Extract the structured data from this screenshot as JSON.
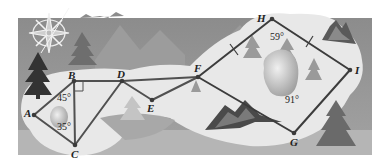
{
  "figure": {
    "colors": {
      "background_dark": "#8a8a8a",
      "background_mid": "#a8a8a8",
      "trail_region": "#e6e6e6",
      "segment_line": "#555555",
      "tree_dark": "#3a3a3a",
      "tree_mid": "#7a7a7a",
      "lake": "#b0b0b0"
    },
    "points": {
      "A": {
        "label": "A",
        "x": 34,
        "y": 115
      },
      "B": {
        "label": "B",
        "x": 74,
        "y": 81
      },
      "C": {
        "label": "C",
        "x": 75,
        "y": 145
      },
      "D": {
        "label": "D",
        "x": 122,
        "y": 81
      },
      "E": {
        "label": "E",
        "x": 152,
        "y": 100
      },
      "F": {
        "label": "F",
        "x": 198,
        "y": 77
      },
      "G": {
        "label": "G",
        "x": 294,
        "y": 133
      },
      "H": {
        "label": "H",
        "x": 272,
        "y": 19
      },
      "I": {
        "label": "I",
        "x": 350,
        "y": 70
      }
    },
    "segments": [
      "AB",
      "BC",
      "CA",
      "BD",
      "DC",
      "DE",
      "EF",
      "DF",
      "FH",
      "HI",
      "IG",
      "GF"
    ],
    "angles": {
      "ABC_upper": "45°",
      "ACB": "35°",
      "H": "59°",
      "G": "91°"
    },
    "markers": {
      "right_angle_at": "B",
      "congruent_tick_segments": [
        "FH",
        "HI"
      ]
    }
  }
}
